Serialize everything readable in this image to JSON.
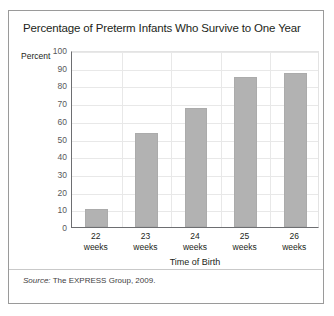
{
  "figure": {
    "title": "Percentage of Preterm Infants Who Survive to One Year",
    "source_keyword": "Source:",
    "source_text": " The EXPRESS Group, 2009.",
    "frame_color": "#9a9a9a"
  },
  "chart_data": {
    "type": "bar",
    "title": "Percentage of Preterm Infants Who Survive to One Year",
    "categories": [
      "22 weeks",
      "23 weeks",
      "24 weeks",
      "25 weeks",
      "26 weeks"
    ],
    "category_lines": [
      {
        "num": "22",
        "word": "weeks"
      },
      {
        "num": "23",
        "word": "weeks"
      },
      {
        "num": "24",
        "word": "weeks"
      },
      {
        "num": "25",
        "word": "weeks"
      },
      {
        "num": "26",
        "word": "weeks"
      }
    ],
    "values": [
      10,
      53,
      67,
      85,
      87
    ],
    "xlabel": "Time of Birth",
    "ylabel": "Percent",
    "ylim": [
      0,
      100
    ],
    "ytick_step": 10,
    "ytick_labels": [
      "100",
      "90",
      "80",
      "70",
      "60",
      "50",
      "40",
      "30",
      "20",
      "10",
      "0"
    ],
    "grid": true,
    "legend": "none",
    "bar_color": "#b2b2b2",
    "gridline_color": "#e8e8e8",
    "axis_color": "#6d6e71"
  }
}
